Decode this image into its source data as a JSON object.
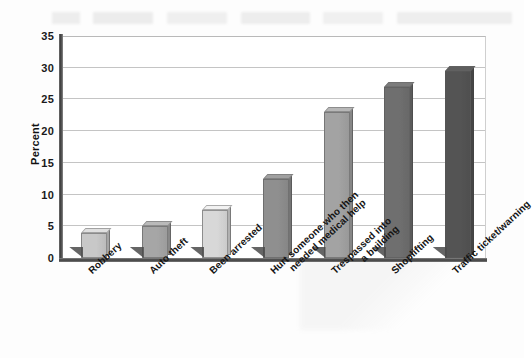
{
  "axis": {
    "y_title": "Percent",
    "y_ticks": [
      "35",
      "30",
      "25",
      "20",
      "15",
      "10",
      "5",
      "0"
    ]
  },
  "chart_data": {
    "type": "bar",
    "title": "",
    "subtitle": "",
    "xlabel": "",
    "ylabel": "Percent",
    "ylim": [
      0,
      35
    ],
    "ytick_step": 5,
    "grid": true,
    "legend": false,
    "categories": [
      "Robbery",
      "Auto theft",
      "Been arrested",
      "Hurt someone who then\nneeded medical help",
      "Trespassed into\na building",
      "Shoplifting",
      "Traffic ticket/warning"
    ],
    "values": [
      4,
      5,
      7.5,
      12.5,
      23,
      27,
      29.5
    ],
    "bar_colors": [
      "#c8c8c8",
      "#a6a6a6",
      "#d8d8d8",
      "#8f8f8f",
      "#a3a3a3",
      "#6f6f6f",
      "#545454"
    ],
    "shadow_color": "#4a4a4a",
    "gridline_color": "#c4c4c4",
    "axis_color": "#3d3d3d",
    "plot_background": "#ffffff"
  }
}
